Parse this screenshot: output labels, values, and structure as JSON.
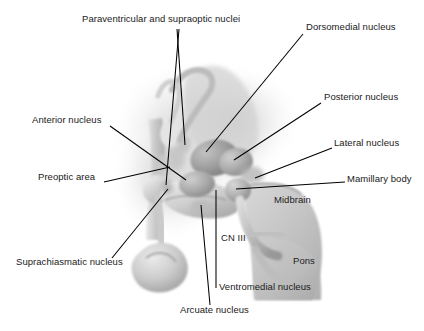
{
  "figure": {
    "background_color": "#ffffff",
    "text_color": "#1a1a1a",
    "leader_line_color": "#000000"
  },
  "labels": {
    "paraventricular": {
      "text": "Paraventricular and supraoptic nuclei",
      "x": 82,
      "y": 18
    },
    "dorsomedial": {
      "text": "Dorsomedial nucleus",
      "x": 306,
      "y": 26
    },
    "posterior": {
      "text": "Posterior nucleus",
      "x": 324,
      "y": 96
    },
    "anterior": {
      "text": "Anterior nucleus",
      "x": 32,
      "y": 119
    },
    "lateral": {
      "text": "Lateral nucleus",
      "x": 334,
      "y": 142
    },
    "preoptic": {
      "text": "Preoptic area",
      "x": 38,
      "y": 176
    },
    "mamillary": {
      "text": "Mamillary body",
      "x": 347,
      "y": 178
    },
    "suprachiasmatic": {
      "text": "Suprachiasmatic nucleus",
      "x": 16,
      "y": 261
    },
    "ventromedial": {
      "text": "Ventromedial nucleus",
      "x": 219,
      "y": 286
    },
    "arcuate": {
      "text": "Arcuate nucleus",
      "x": 180,
      "y": 309
    }
  },
  "inner_labels": {
    "cn3": {
      "text": "CN III",
      "x": 221,
      "y": 237
    },
    "midbrain": {
      "text": "Midbrain",
      "x": 274,
      "y": 199
    },
    "pons": {
      "text": "Pons",
      "x": 293,
      "y": 260
    }
  },
  "anatomy": {
    "palette": {
      "halo": "#e2e2e2",
      "tissue_light": "#d9d9d9",
      "tissue_mid": "#bdbdbd",
      "tissue_dark": "#9a9a9a",
      "tissue_deep": "#7e7e7e",
      "outline": "#8a8a8a",
      "brainstem": "#c8c8c8",
      "highlight": "#f0f0f0"
    },
    "regions": [
      "optic chiasm",
      "pituitary stalk",
      "third ventricle wall",
      "mamillary body",
      "midbrain",
      "pons",
      "oculomotor nerve"
    ]
  },
  "leader_lines": [
    {
      "name": "paraventricular-a",
      "x1": 177,
      "y1": 29,
      "x2": 185,
      "y2": 145
    },
    {
      "name": "paraventricular-b",
      "x1": 179,
      "y1": 29,
      "x2": 166,
      "y2": 185
    },
    {
      "name": "dorsomedial",
      "x1": 303,
      "y1": 34,
      "x2": 206,
      "y2": 152
    },
    {
      "name": "posterior",
      "x1": 321,
      "y1": 103,
      "x2": 234,
      "y2": 160
    },
    {
      "name": "anterior",
      "x1": 110,
      "y1": 126,
      "x2": 186,
      "y2": 180
    },
    {
      "name": "lateral",
      "x1": 332,
      "y1": 148,
      "x2": 255,
      "y2": 178
    },
    {
      "name": "preoptic",
      "x1": 104,
      "y1": 182,
      "x2": 170,
      "y2": 167
    },
    {
      "name": "mamillary",
      "x1": 345,
      "y1": 182,
      "x2": 236,
      "y2": 189
    },
    {
      "name": "suprachiasmatic",
      "x1": 112,
      "y1": 258,
      "x2": 168,
      "y2": 189
    },
    {
      "name": "ventromedial",
      "x1": 216,
      "y1": 288,
      "x2": 216,
      "y2": 190
    },
    {
      "name": "arcuate",
      "x1": 210,
      "y1": 305,
      "x2": 201,
      "y2": 205
    }
  ]
}
